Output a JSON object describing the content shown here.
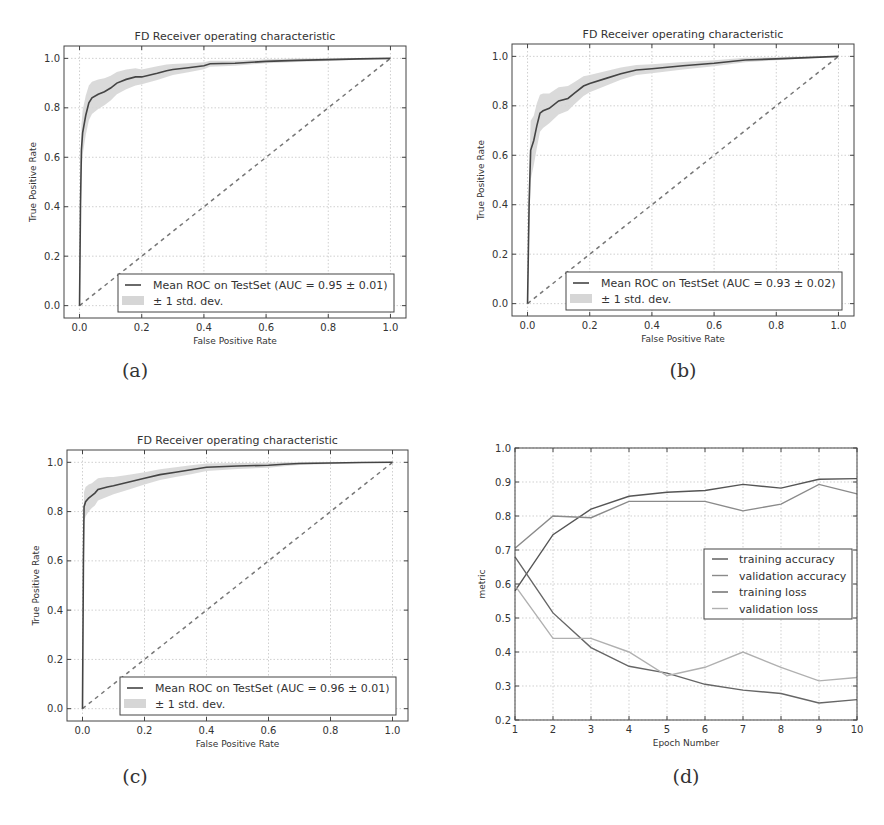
{
  "figure": {
    "captions": [
      "(a)",
      "(b)",
      "(c)",
      "(d)"
    ]
  },
  "chart_data": [
    {
      "id": "a",
      "type": "line",
      "title": "FD Receiver operating characteristic",
      "xlabel": "False Positive Rate",
      "ylabel": "True Positive Rate",
      "xlim": [
        -0.05,
        1.05
      ],
      "ylim": [
        -0.05,
        1.05
      ],
      "xticks": [
        "0.0",
        "0.2",
        "0.4",
        "0.6",
        "0.8",
        "1.0"
      ],
      "yticks": [
        "0.0",
        "0.2",
        "0.4",
        "0.6",
        "0.8",
        "1.0"
      ],
      "grid": true,
      "legend": {
        "position": "lower right",
        "entries": [
          "Mean ROC on TestSet (AUC = 0.95 ± 0.01)",
          "± 1 std. dev."
        ]
      },
      "series": [
        {
          "name": "Mean ROC on TestSet (AUC = 0.95 ± 0.01)",
          "x": [
            0,
            0.003,
            0.006,
            0.01,
            0.02,
            0.03,
            0.04,
            0.06,
            0.08,
            0.1,
            0.12,
            0.15,
            0.18,
            0.2,
            0.25,
            0.28,
            0.3,
            0.35,
            0.4,
            0.42,
            0.5,
            0.6,
            0.7,
            0.8,
            0.9,
            1.0
          ],
          "y": [
            0,
            0.4,
            0.63,
            0.7,
            0.77,
            0.82,
            0.84,
            0.855,
            0.865,
            0.88,
            0.9,
            0.915,
            0.925,
            0.925,
            0.94,
            0.95,
            0.955,
            0.962,
            0.97,
            0.978,
            0.98,
            0.988,
            0.992,
            0.995,
            0.998,
            1.0
          ]
        },
        {
          "name": "± 1 std. dev.",
          "std": [
            0,
            0.1,
            0.1,
            0.09,
            0.08,
            0.07,
            0.065,
            0.06,
            0.055,
            0.05,
            0.045,
            0.04,
            0.035,
            0.03,
            0.028,
            0.025,
            0.022,
            0.018,
            0.014,
            0.012,
            0.01,
            0.008,
            0.007,
            0.006,
            0.004,
            0
          ]
        },
        {
          "name": "chance",
          "x": [
            0,
            1
          ],
          "y": [
            0,
            1
          ],
          "style": "dashed"
        }
      ]
    },
    {
      "id": "b",
      "type": "line",
      "title": "FD Receiver operating characteristic",
      "xlabel": "False Positive Rate",
      "ylabel": "True Positive Rate",
      "xlim": [
        -0.05,
        1.05
      ],
      "ylim": [
        -0.05,
        1.05
      ],
      "xticks": [
        "0.0",
        "0.2",
        "0.4",
        "0.6",
        "0.8",
        "1.0"
      ],
      "yticks": [
        "0.0",
        "0.2",
        "0.4",
        "0.6",
        "0.8",
        "1.0"
      ],
      "grid": true,
      "legend": {
        "position": "lower right",
        "entries": [
          "Mean ROC on TestSet (AUC = 0.93 ± 0.02)",
          "± 1 std. dev."
        ]
      },
      "series": [
        {
          "name": "Mean ROC on TestSet (AUC = 0.93 ± 0.02)",
          "x": [
            0,
            0.005,
            0.01,
            0.02,
            0.03,
            0.04,
            0.05,
            0.07,
            0.1,
            0.13,
            0.15,
            0.18,
            0.2,
            0.25,
            0.3,
            0.35,
            0.4,
            0.5,
            0.6,
            0.7,
            0.8,
            0.9,
            1.0
          ],
          "y": [
            0,
            0.4,
            0.62,
            0.66,
            0.72,
            0.77,
            0.78,
            0.79,
            0.82,
            0.83,
            0.85,
            0.88,
            0.89,
            0.91,
            0.93,
            0.945,
            0.95,
            0.962,
            0.972,
            0.985,
            0.99,
            0.995,
            1.0
          ]
        },
        {
          "name": "± 1 std. dev.",
          "std": [
            0,
            0.12,
            0.12,
            0.1,
            0.09,
            0.075,
            0.07,
            0.06,
            0.055,
            0.05,
            0.045,
            0.04,
            0.035,
            0.03,
            0.025,
            0.02,
            0.018,
            0.015,
            0.012,
            0.009,
            0.006,
            0.004,
            0
          ]
        },
        {
          "name": "chance",
          "x": [
            0,
            1
          ],
          "y": [
            0,
            1
          ],
          "style": "dashed"
        }
      ]
    },
    {
      "id": "c",
      "type": "line",
      "title": "FD Receiver operating characteristic",
      "xlabel": "False Positive Rate",
      "ylabel": "True Positive Rate",
      "xlim": [
        -0.05,
        1.05
      ],
      "ylim": [
        -0.05,
        1.05
      ],
      "xticks": [
        "0.0",
        "0.2",
        "0.4",
        "0.6",
        "0.8",
        "1.0"
      ],
      "yticks": [
        "0.0",
        "0.2",
        "0.4",
        "0.6",
        "0.8",
        "1.0"
      ],
      "grid": true,
      "legend": {
        "position": "lower right",
        "entries": [
          "Mean ROC on TestSet (AUC = 0.96 ± 0.01)",
          "± 1 std. dev."
        ]
      },
      "series": [
        {
          "name": "Mean ROC on TestSet (AUC = 0.96 ± 0.01)",
          "x": [
            0,
            0.003,
            0.005,
            0.01,
            0.02,
            0.03,
            0.04,
            0.05,
            0.08,
            0.1,
            0.15,
            0.2,
            0.25,
            0.3,
            0.35,
            0.4,
            0.5,
            0.6,
            0.65,
            0.7,
            0.8,
            0.9,
            1.0
          ],
          "y": [
            0,
            0.6,
            0.82,
            0.84,
            0.855,
            0.865,
            0.875,
            0.89,
            0.9,
            0.905,
            0.92,
            0.935,
            0.95,
            0.96,
            0.97,
            0.98,
            0.985,
            0.988,
            0.992,
            0.995,
            0.997,
            0.999,
            1.0
          ]
        },
        {
          "name": "± 1 std. dev.",
          "std": [
            0,
            0.06,
            0.06,
            0.06,
            0.055,
            0.05,
            0.05,
            0.045,
            0.04,
            0.035,
            0.03,
            0.025,
            0.022,
            0.02,
            0.018,
            0.015,
            0.012,
            0.01,
            0.008,
            0.006,
            0.004,
            0.002,
            0
          ]
        },
        {
          "name": "chance",
          "x": [
            0,
            1
          ],
          "y": [
            0,
            1
          ],
          "style": "dashed"
        }
      ]
    },
    {
      "id": "d",
      "type": "line",
      "title": "",
      "xlabel": "Epoch Number",
      "ylabel": "metric",
      "xlim": [
        1,
        10
      ],
      "ylim": [
        0.2,
        1.0
      ],
      "xticks": [
        "1",
        "2",
        "3",
        "4",
        "5",
        "6",
        "7",
        "8",
        "9",
        "10"
      ],
      "yticks": [
        "0.2",
        "0.3",
        "0.4",
        "0.5",
        "0.6",
        "0.7",
        "0.8",
        "0.9",
        "1.0"
      ],
      "grid": true,
      "legend": {
        "position": "center right",
        "entries": [
          "training accuracy",
          "validation accuracy",
          "training loss",
          "validation loss"
        ]
      },
      "categories": [
        1,
        2,
        3,
        4,
        5,
        6,
        7,
        8,
        9,
        10
      ],
      "series": [
        {
          "name": "training accuracy",
          "color": "#555555",
          "values": [
            0.58,
            0.745,
            0.82,
            0.858,
            0.87,
            0.875,
            0.893,
            0.882,
            0.908,
            0.91
          ]
        },
        {
          "name": "validation accuracy",
          "color": "#8a8a8a",
          "values": [
            0.705,
            0.8,
            0.795,
            0.843,
            0.843,
            0.843,
            0.815,
            0.835,
            0.893,
            0.865
          ]
        },
        {
          "name": "training loss",
          "color": "#666666",
          "values": [
            0.68,
            0.515,
            0.413,
            0.358,
            0.338,
            0.305,
            0.288,
            0.278,
            0.25,
            0.26
          ]
        },
        {
          "name": "validation loss",
          "color": "#b0b0b0",
          "values": [
            0.595,
            0.44,
            0.44,
            0.4,
            0.33,
            0.355,
            0.4,
            0.355,
            0.315,
            0.325
          ]
        }
      ]
    }
  ]
}
